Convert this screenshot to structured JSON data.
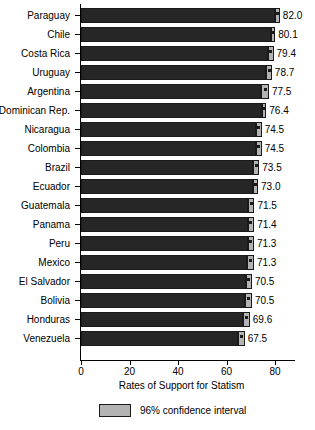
{
  "chart_data": {
    "type": "bar",
    "title": "",
    "xlabel": "Rates of Support for Statism",
    "ylabel": "",
    "orientation": "horizontal",
    "xlim": [
      0,
      90
    ],
    "xticks": [
      0,
      20,
      40,
      60,
      80
    ],
    "xtick_labels": [
      "0",
      "20",
      "40",
      "60",
      "80"
    ],
    "grid": false,
    "legend_position": "bottom",
    "legend": [
      {
        "label": "96% confidence interval",
        "swatch": "#b3b3b3"
      }
    ],
    "colors": {
      "bar": "#262626",
      "ci": "#b3b3b3",
      "outline": "#1a1a1a",
      "axis": "#000000"
    },
    "categories": [
      "Paraguay",
      "Chile",
      "Costa Rica",
      "Uruguay",
      "Argentina",
      "Dominican Rep.",
      "Nicaragua",
      "Colombia",
      "Brazil",
      "Ecuador",
      "Guatemala",
      "Panama",
      "Peru",
      "Mexico",
      "El Salvador",
      "Bolivia",
      "Honduras",
      "Venezuela"
    ],
    "values": [
      82.0,
      80.1,
      79.4,
      78.7,
      77.5,
      76.4,
      74.5,
      74.5,
      73.5,
      73.0,
      71.5,
      71.4,
      71.3,
      71.3,
      70.5,
      70.5,
      69.6,
      67.5
    ],
    "value_labels": [
      "82.0",
      "80.1",
      "79.4",
      "78.7",
      "77.5",
      "76.4",
      "74.5",
      "74.5",
      "73.5",
      "73.0",
      "71.5",
      "71.4",
      "71.3",
      "71.3",
      "70.5",
      "70.5",
      "69.6",
      "67.5"
    ],
    "ci_low": [
      79.8,
      78.4,
      77.3,
      76.4,
      74.4,
      74.8,
      72.2,
      72.3,
      71.0,
      71.0,
      69.0,
      68.8,
      68.9,
      68.6,
      68.0,
      67.6,
      66.8,
      64.6
    ],
    "ci_high": [
      82.0,
      80.1,
      79.4,
      78.7,
      77.5,
      76.4,
      74.5,
      74.5,
      73.5,
      73.0,
      71.5,
      71.4,
      71.3,
      71.3,
      70.5,
      70.5,
      69.6,
      67.5
    ],
    "series": [
      {
        "name": "Rates of Support for Statism",
        "values": [
          82.0,
          80.1,
          79.4,
          78.7,
          77.5,
          76.4,
          74.5,
          74.5,
          73.5,
          73.0,
          71.5,
          71.4,
          71.3,
          71.3,
          70.5,
          70.5,
          69.6,
          67.5
        ]
      }
    ]
  }
}
